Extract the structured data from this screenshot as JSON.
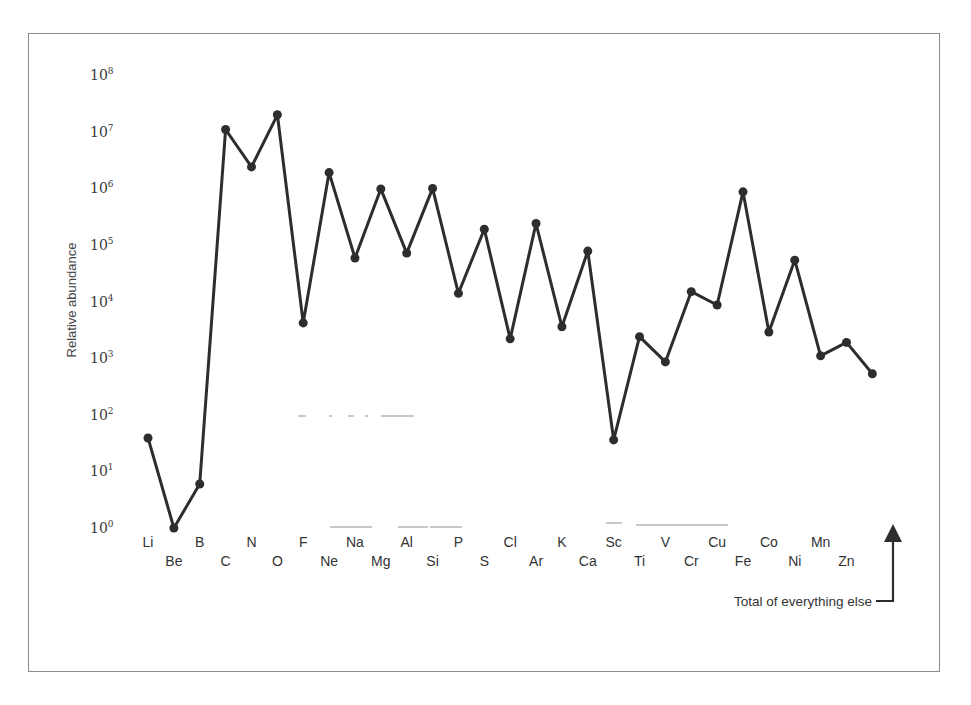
{
  "chart_data": {
    "type": "line",
    "title": "",
    "xlabel": "",
    "ylabel": "Relative abundance",
    "yscale": "log",
    "ylim": [
      1,
      100000000
    ],
    "y_ticks": [
      {
        "base": "10",
        "exp": "0",
        "value": 1
      },
      {
        "base": "10",
        "exp": "1",
        "value": 10
      },
      {
        "base": "10",
        "exp": "2",
        "value": 100
      },
      {
        "base": "10",
        "exp": "3",
        "value": 1000
      },
      {
        "base": "10",
        "exp": "4",
        "value": 10000
      },
      {
        "base": "10",
        "exp": "5",
        "value": 100000
      },
      {
        "base": "10",
        "exp": "6",
        "value": 1000000
      },
      {
        "base": "10",
        "exp": "7",
        "value": 10000000
      },
      {
        "base": "10",
        "exp": "8",
        "value": 100000000
      }
    ],
    "grid": false,
    "legend": null,
    "categories": [
      "Li",
      "Be",
      "B",
      "C",
      "N",
      "O",
      "F",
      "Ne",
      "Na",
      "Mg",
      "Al",
      "Si",
      "P",
      "S",
      "Cl",
      "Ar",
      "K",
      "Ca",
      "Sc",
      "Ti",
      "V",
      "Cr",
      "Cu",
      "Fe",
      "Co",
      "Ni",
      "Mn",
      "Zn",
      "Total"
    ],
    "series": [
      {
        "name": "Relative abundance",
        "values": [
          39,
          1,
          6,
          11000000,
          2400000,
          20000000,
          4200,
          1900000,
          59000,
          980000,
          72000,
          1000000,
          14000,
          190000,
          2200,
          240000,
          3600,
          78000,
          36,
          2400,
          860,
          15000,
          8700,
          870000,
          2900,
          54000,
          1100,
          1900,
          530
        ]
      }
    ],
    "annotations": [
      {
        "text": "Total of everything else",
        "target": "Total",
        "style": "arrow"
      }
    ]
  },
  "axis": {
    "y_title": "Relative abundance"
  },
  "annotation": {
    "total_note": "Total of everything else"
  }
}
